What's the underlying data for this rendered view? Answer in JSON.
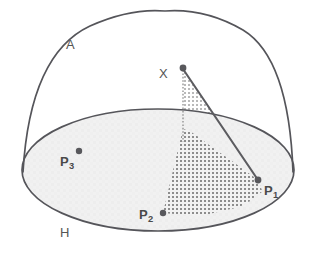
{
  "figure": {
    "labels": {
      "dome": "A",
      "base_plane": "H",
      "apex": "X",
      "point1": "P",
      "point1_sub": "1",
      "point2": "P",
      "point2_sub": "2",
      "point3": "P",
      "point3_sub": "3"
    },
    "colors": {
      "stroke": "#55555a",
      "base_fill": "#f0f0f0",
      "hatch_dark": "#8a8a8a",
      "hatch_light": "#b8b8b8",
      "point_fill": "#58585c",
      "label_text": "#4a4a4a",
      "background": "#ffffff"
    },
    "geometry": {
      "canvas": {
        "width": 315,
        "height": 257
      },
      "dome_apex": {
        "x": 165,
        "y": 11
      },
      "ellipse_center": {
        "x": 158,
        "y": 170
      },
      "ellipse_rx": 136,
      "ellipse_ry": 61,
      "apex_point_X": {
        "x": 183,
        "y": 68
      },
      "point_P1": {
        "x": 258,
        "y": 180
      },
      "point_P2": {
        "x": 163,
        "y": 213
      },
      "point_P3": {
        "x": 79,
        "y": 151
      }
    }
  }
}
